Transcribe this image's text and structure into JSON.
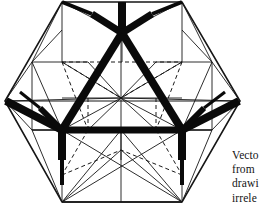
{
  "page": {
    "background_color": "#ffffff",
    "ink_color": "#111111",
    "width": 268,
    "height": 209
  },
  "figure": {
    "name": "vector-equilibrium-wireframe",
    "stroke_color": "#111111",
    "thin_stroke_width": 0.9,
    "medium_stroke_width": 1.5,
    "bold_stroke_width": 7,
    "dashed_stroke_width": 1.0,
    "dash_pattern": "4 3",
    "center": {
      "x": 121,
      "y": 98
    },
    "outer_hexagon_vertices": [
      {
        "x": 62,
        "y": 2
      },
      {
        "x": 182,
        "y": 2
      },
      {
        "x": 240,
        "y": 101
      },
      {
        "x": 182,
        "y": 202
      },
      {
        "x": 62,
        "y": 202
      },
      {
        "x": 5,
        "y": 101
      }
    ],
    "inner_hexagon_vertices": [
      {
        "x": 62,
        "y": 62
      },
      {
        "x": 182,
        "y": 62
      },
      {
        "x": 212,
        "y": 130
      },
      {
        "x": 182,
        "y": 130
      },
      {
        "x": 62,
        "y": 130
      },
      {
        "x": 32,
        "y": 130
      }
    ],
    "bold_triangle_vertices": [
      {
        "x": 122,
        "y": 33
      },
      {
        "x": 62,
        "y": 130
      },
      {
        "x": 182,
        "y": 130
      }
    ],
    "bold_junction_spokes": 3,
    "radiating_spoke_count": 12
  },
  "caption": {
    "name": "figure-caption",
    "clipped_at_right_edge": true,
    "lines": [
      "Vecto",
      "from",
      "drawi",
      "irrele"
    ]
  }
}
